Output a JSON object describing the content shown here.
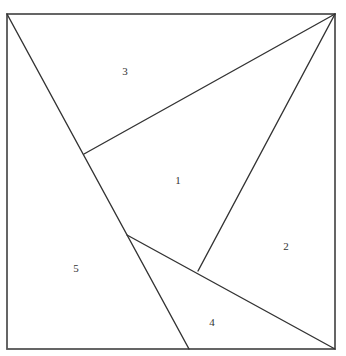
{
  "diagram": {
    "frame": {
      "x": 7,
      "y": 14,
      "width": 328,
      "height": 335
    },
    "vertices": {
      "A_top_left": [
        7,
        14
      ],
      "B_top_right": [
        335,
        14
      ],
      "C_bottom_right": [
        335,
        349
      ],
      "D_bottom_left": [
        7,
        349
      ],
      "E_diag_upper": [
        84,
        154
      ],
      "F_diag_lower": [
        127,
        235
      ],
      "G_inner": [
        198,
        271
      ],
      "H_bottom": [
        189,
        349
      ]
    },
    "segments": [
      {
        "name": "diagonal-top-left-to-bottom",
        "from": [
          7,
          14
        ],
        "to": [
          189,
          349
        ]
      },
      {
        "name": "top-right-to-upper-diagonal-point",
        "from": [
          335,
          14
        ],
        "to": [
          84,
          154
        ]
      },
      {
        "name": "top-right-to-inner-point",
        "from": [
          335,
          14
        ],
        "to": [
          198,
          271
        ]
      },
      {
        "name": "lower-diagonal-point-to-bottom-right",
        "from": [
          127,
          235
        ],
        "to": [
          335,
          349
        ]
      }
    ],
    "labels": [
      {
        "id": "piece-1",
        "text": "1",
        "x": 178,
        "y": 180
      },
      {
        "id": "piece-2",
        "text": "2",
        "x": 286,
        "y": 246
      },
      {
        "id": "piece-3",
        "text": "3",
        "x": 125,
        "y": 71
      },
      {
        "id": "piece-4",
        "text": "4",
        "x": 212,
        "y": 322
      },
      {
        "id": "piece-5",
        "text": "5",
        "x": 76,
        "y": 268
      }
    ],
    "colors": {
      "line": "#333333",
      "frame": "#555555",
      "text": "#333333",
      "background": "#ffffff"
    }
  }
}
